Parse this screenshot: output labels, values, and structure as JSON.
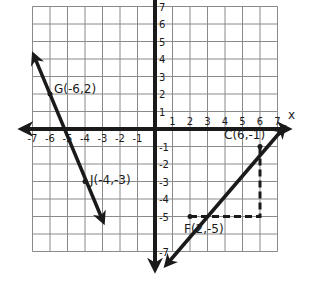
{
  "diagram": {
    "type": "coordinate-plane",
    "grid": {
      "x_min": -7,
      "x_max": 7,
      "y_min": -7,
      "y_max": 7
    },
    "axes": {
      "x_label": "x",
      "y_label": "y"
    },
    "x_ticks": [
      "-7",
      "-6",
      "-5",
      "-4",
      "-3",
      "-2",
      "-1",
      "1",
      "2",
      "3",
      "4",
      "5",
      "6",
      "7"
    ],
    "y_ticks": [
      "7",
      "6",
      "5",
      "4",
      "3",
      "2",
      "1",
      "-1",
      "-2",
      "-3",
      "-4",
      "-5",
      "-7"
    ],
    "points": [
      {
        "name": "G",
        "x": -6,
        "y": 2,
        "label": "G(-6,2)"
      },
      {
        "name": "J",
        "x": -4,
        "y": -3,
        "label": "J(-4,-3)"
      },
      {
        "name": "C",
        "x": 6,
        "y": -1,
        "label": "C(6,-1)"
      },
      {
        "name": "F",
        "x": 2,
        "y": -5,
        "label": "F(2,-5)"
      }
    ],
    "lines": [
      {
        "through": [
          "G",
          "J"
        ],
        "arrows": "both"
      },
      {
        "through": [
          "F",
          "C"
        ],
        "arrows": "both"
      }
    ],
    "slope_triangle": {
      "from": "F",
      "corner": {
        "x": 6,
        "y": -5
      },
      "to": "C",
      "style": "dashed"
    },
    "colors": {
      "grid": "#8a8a8a",
      "ink": "#1a1a1a",
      "background": "#ffffff"
    }
  }
}
